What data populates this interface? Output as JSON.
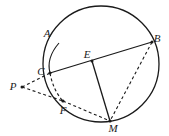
{
  "figure": {
    "kind": "geometry-diagram",
    "background_color": "#ffffff",
    "stroke_color": "#1a1a1a",
    "label_color": "#1a1a1a",
    "canvas": {
      "width": 169,
      "height": 136
    },
    "circle": {
      "name": "main-circle",
      "center_x": 101,
      "center_y": 64,
      "radius": 58,
      "stroke_width": 1.3,
      "style": "solid"
    },
    "points": [
      {
        "id": "A",
        "label": "A",
        "x": 59,
        "y": 43,
        "label_x": 47,
        "label_y": 33
      },
      {
        "id": "B",
        "label": "B",
        "x": 152,
        "y": 42,
        "label_x": 157,
        "label_y": 38
      },
      {
        "id": "C",
        "label": "C",
        "x": 50,
        "y": 73,
        "label_x": 41,
        "label_y": 71
      },
      {
        "id": "E",
        "label": "E",
        "x": 92,
        "y": 61,
        "label_x": 87,
        "label_y": 54
      },
      {
        "id": "F",
        "label": "F",
        "x": 63,
        "y": 101,
        "label_x": 63,
        "label_y": 110
      },
      {
        "id": "M",
        "label": "M",
        "x": 110,
        "y": 121,
        "label_x": 113,
        "label_y": 128
      },
      {
        "id": "P",
        "label": "P",
        "x": 22,
        "y": 87,
        "label_x": 13,
        "label_y": 86
      }
    ],
    "segments": [
      {
        "id": "CB",
        "from": "C",
        "to": "B",
        "style": "solid",
        "stroke_width": 1.3,
        "name": "chord-c-b"
      },
      {
        "id": "EM",
        "from": "E",
        "to": "M",
        "style": "solid",
        "stroke_width": 1.3,
        "name": "segment-e-m"
      },
      {
        "id": "PC",
        "from": "P",
        "to": "C",
        "style": "dashed",
        "stroke_width": 1.1,
        "name": "secant-p-c"
      },
      {
        "id": "PF",
        "from": "P",
        "to": "F",
        "style": "dashed",
        "stroke_width": 1.1,
        "name": "secant-p-f"
      },
      {
        "id": "FM",
        "from": "F",
        "to": "M",
        "style": "dashed",
        "stroke_width": 1.1,
        "name": "chord-f-m"
      },
      {
        "id": "BM",
        "from": "B",
        "to": "M",
        "style": "dashed",
        "stroke_width": 1.1,
        "name": "chord-b-m"
      }
    ],
    "arcs": [
      {
        "id": "ACarc",
        "from": "A",
        "to": "C",
        "style": "solid",
        "stroke_width": 1.2,
        "name": "arc-a-c-inner"
      },
      {
        "id": "CFarc",
        "from": "C",
        "to": "F",
        "style": "dashed",
        "stroke_width": 1.1,
        "name": "arc-c-f-inner"
      }
    ],
    "markers": [
      {
        "id": "dot-C",
        "at": "C",
        "r": 1.6,
        "name": "point-dot-c"
      },
      {
        "id": "dot-E",
        "at": "E",
        "r": 1.5,
        "name": "point-dot-e"
      },
      {
        "id": "dot-F",
        "at": "F",
        "r": 1.6,
        "name": "point-dot-f"
      },
      {
        "id": "dot-M",
        "at": "M",
        "r": 1.6,
        "name": "point-dot-m"
      },
      {
        "id": "dot-B",
        "at": "B",
        "r": 1.5,
        "name": "point-dot-b"
      },
      {
        "id": "dot-P",
        "at": "P",
        "r": 1.5,
        "name": "point-dot-p"
      }
    ]
  }
}
